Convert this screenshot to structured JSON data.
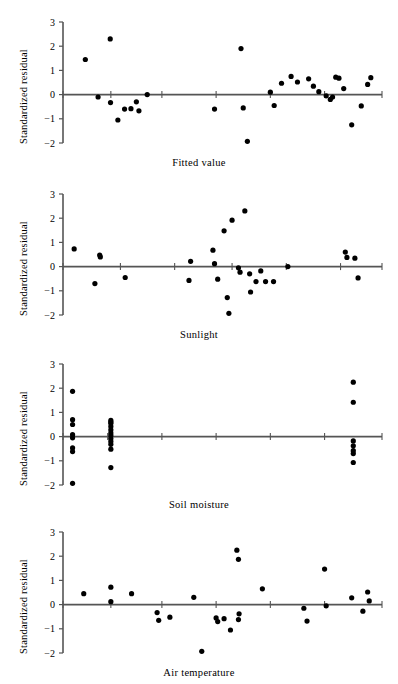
{
  "figure": {
    "title": "",
    "ylabel": "Standardized residual",
    "panels": [
      {
        "name": "fitted-value",
        "xlabel": "Fitted value"
      },
      {
        "name": "sunlight",
        "xlabel": "Sunlight"
      },
      {
        "name": "soil-moisture",
        "xlabel": "Soil moisture"
      },
      {
        "name": "air-temperature",
        "xlabel": "Air temperature"
      }
    ],
    "ytick_labels": [
      "3",
      "2",
      "1",
      "0",
      "−1",
      "−2"
    ],
    "ytick_values": [
      3,
      2,
      1,
      0,
      -1,
      -2
    ]
  },
  "chart_data": [
    {
      "type": "scatter",
      "title": "",
      "xlabel": "Fitted value",
      "ylabel": "Standardized residual",
      "ylim": [
        -2,
        3
      ],
      "xlim": [
        0,
        100
      ],
      "yticks": [
        3,
        2,
        1,
        0,
        -1,
        -2
      ],
      "ytick_labels": [
        "3",
        "2",
        "1",
        "0",
        "-1",
        "-2"
      ],
      "xticks": [
        0,
        15,
        31,
        48,
        65,
        82,
        100
      ],
      "xtick_labels": [
        "",
        "",
        "",
        "",
        "",
        "",
        ""
      ],
      "grid": false,
      "legend": null,
      "zero_line": true,
      "x": [
        7.0,
        11.0,
        14.8,
        14.9,
        17.2,
        19.3,
        21.3,
        23.0,
        23.8,
        26.4,
        47.5,
        55.8,
        56.5,
        57.8,
        65.0,
        66.2,
        68.5,
        71.5,
        73.5,
        77.0,
        78.5,
        80.2,
        82.5,
        83.8,
        84.5,
        85.5,
        86.5,
        88.0,
        90.5,
        93.5,
        95.5,
        96.5
      ],
      "y": [
        1.45,
        -0.1,
        2.3,
        -0.33,
        -1.05,
        -0.6,
        -0.58,
        -0.3,
        -0.67,
        0.0,
        -0.6,
        1.9,
        -0.55,
        -1.93,
        0.1,
        -0.45,
        0.47,
        0.75,
        0.52,
        0.65,
        0.35,
        0.12,
        -0.05,
        -0.2,
        -0.1,
        0.72,
        0.68,
        0.25,
        -1.25,
        -0.47,
        0.42,
        0.7
      ]
    },
    {
      "type": "scatter",
      "title": "",
      "xlabel": "Sunlight",
      "ylabel": "Standardized residual",
      "ylim": [
        -2,
        3
      ],
      "xlim": [
        0,
        100
      ],
      "yticks": [
        3,
        2,
        1,
        0,
        -1,
        -2
      ],
      "ytick_labels": [
        "3",
        "2",
        "1",
        "0",
        "-1",
        "-2"
      ],
      "xticks": [
        0,
        18,
        35,
        53,
        70,
        87,
        100
      ],
      "xtick_labels": [
        "",
        "",
        "",
        "",
        "",
        "",
        ""
      ],
      "grid": false,
      "legend": null,
      "zero_line": true,
      "x": [
        3.5,
        11.5,
        11.7,
        10.0,
        19.5,
        40.0,
        39.5,
        47.0,
        47.5,
        48.5,
        50.5,
        51.5,
        52.0,
        53.0,
        55.0,
        55.5,
        57.0,
        58.5,
        58.8,
        60.5,
        62.0,
        63.5,
        66.0,
        70.5,
        88.5,
        89.0,
        91.5,
        92.5
      ],
      "y": [
        0.73,
        0.48,
        0.4,
        -0.7,
        -0.45,
        0.22,
        -0.57,
        0.68,
        0.12,
        -0.52,
        1.48,
        -1.28,
        -1.93,
        1.92,
        -0.05,
        -0.23,
        2.3,
        -0.3,
        -1.05,
        -0.62,
        -0.18,
        -0.62,
        -0.62,
        0.0,
        0.6,
        0.38,
        0.35,
        -0.47
      ]
    },
    {
      "type": "scatter",
      "title": "",
      "xlabel": "Soil moisture",
      "ylabel": "Standardized residual",
      "ylim": [
        -2,
        3
      ],
      "xlim": [
        0,
        100
      ],
      "yticks": [
        3,
        2,
        1,
        0,
        -1,
        -2
      ],
      "ytick_labels": [
        "3",
        "2",
        "1",
        "0",
        "-1",
        "-2"
      ],
      "xticks": [
        0,
        14,
        31,
        48,
        65,
        82,
        100
      ],
      "xtick_labels": [
        "",
        "",
        "",
        "",
        "",
        "",
        ""
      ],
      "grid": false,
      "legend": null,
      "zero_line": true,
      "x": [
        3.0,
        3.0,
        3.0,
        3.0,
        3.0,
        3.0,
        3.0,
        3.0,
        15.0,
        15.0,
        15.0,
        15.0,
        15.0,
        15.0,
        15.0,
        15.0,
        15.0,
        15.0,
        15.0,
        15.0,
        91.0,
        91.0,
        91.0,
        91.0,
        91.0,
        91.0,
        91.0
      ],
      "y": [
        1.87,
        0.7,
        0.5,
        0.08,
        -0.05,
        -0.47,
        -0.62,
        -1.93,
        0.67,
        0.55,
        0.42,
        0.28,
        0.15,
        0.05,
        -0.08,
        -0.2,
        -0.32,
        -0.52,
        -1.28,
        0.6,
        2.25,
        1.42,
        -0.18,
        -0.38,
        -0.58,
        -0.7,
        -1.07
      ]
    },
    {
      "type": "scatter",
      "title": "",
      "xlabel": "Air temperature",
      "ylabel": "Standardized residual",
      "ylim": [
        -2,
        3
      ],
      "xlim": [
        0,
        100
      ],
      "yticks": [
        3,
        2,
        1,
        0,
        -1,
        -2
      ],
      "ytick_labels": [
        "3",
        "2",
        "1",
        "0",
        "-1",
        "-2"
      ],
      "xticks": [
        0,
        15,
        31,
        48,
        65,
        82,
        100
      ],
      "xtick_labels": [
        "",
        "",
        "",
        "",
        "",
        "",
        ""
      ],
      "grid": false,
      "legend": null,
      "zero_line": true,
      "x": [
        6.5,
        15.0,
        15.0,
        21.5,
        29.5,
        30.0,
        33.5,
        41.0,
        48.0,
        48.5,
        50.5,
        54.5,
        55.0,
        55.2,
        55.0,
        52.5,
        43.5,
        62.5,
        75.5,
        76.5,
        82.0,
        82.5,
        90.5,
        95.5,
        96.0,
        94.0
      ],
      "y": [
        0.45,
        0.72,
        0.12,
        0.45,
        -0.33,
        -0.65,
        -0.52,
        0.3,
        -0.55,
        -0.7,
        -0.58,
        2.25,
        1.87,
        -0.38,
        -0.62,
        -1.05,
        -1.93,
        0.65,
        -0.15,
        -0.68,
        1.47,
        -0.05,
        0.28,
        0.52,
        0.15,
        -0.27
      ]
    }
  ]
}
